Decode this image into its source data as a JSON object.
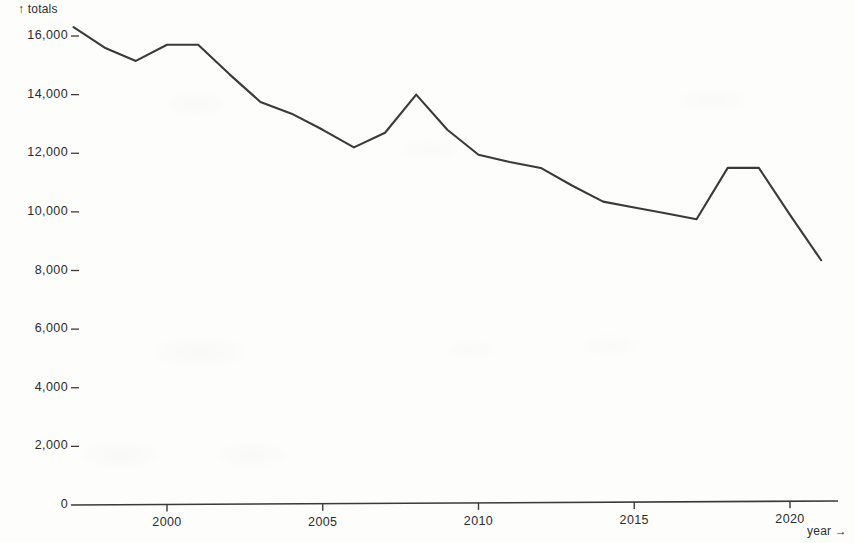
{
  "axes": {
    "y_caption": "↑ totals",
    "x_caption": "year →",
    "y_ticks": [
      "0",
      "2,000",
      "4,000",
      "6,000",
      "8,000",
      "10,000",
      "12,000",
      "14,000",
      "16,000"
    ],
    "x_ticks": [
      "2000",
      "2005",
      "2010",
      "2015",
      "2020"
    ]
  },
  "chart_data": {
    "type": "line",
    "title": "",
    "subtitle": "",
    "xlabel": "year",
    "ylabel": "totals",
    "xlim": [
      1997,
      2021
    ],
    "ylim": [
      0,
      16800
    ],
    "grid": false,
    "legend": null,
    "x_tick_values": [
      2000,
      2005,
      2010,
      2015,
      2020
    ],
    "y_tick_values": [
      0,
      2000,
      4000,
      6000,
      8000,
      10000,
      12000,
      14000,
      16000
    ],
    "line_color": "#3a3a3a",
    "series": [
      {
        "name": "totals",
        "x": [
          1997,
          1998,
          1999,
          2000,
          2001,
          2002,
          2003,
          2004,
          2005,
          2006,
          2007,
          2008,
          2009,
          2010,
          2011,
          2012,
          2013,
          2014,
          2015,
          2016,
          2017,
          2018,
          2019,
          2020,
          2021
        ],
        "values": [
          16300,
          15600,
          15150,
          15700,
          15700,
          14700,
          13750,
          13350,
          12800,
          12200,
          12700,
          14000,
          12800,
          11950,
          11700,
          11500,
          10900,
          10350,
          10150,
          9950,
          9750,
          11500,
          11500,
          9900,
          8350
        ]
      }
    ]
  }
}
